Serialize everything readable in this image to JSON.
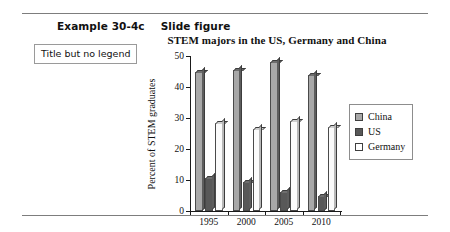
{
  "header": {
    "example_label": "Example 30-4c",
    "kind_label": "Slide figure"
  },
  "callout": {
    "text": "Title but no legend"
  },
  "chart_data": {
    "type": "bar",
    "title": "STEM majors in the US, Germany and China",
    "xlabel": "",
    "ylabel": "Percent of STEM graduates",
    "categories": [
      "1995",
      "2000",
      "2005",
      "2010"
    ],
    "yticks": [
      "0",
      "10",
      "20",
      "30",
      "40",
      "50"
    ],
    "ylim": [
      0,
      50
    ],
    "grid": false,
    "legend_position": "right",
    "series": [
      {
        "name": "China",
        "values": [
          45,
          45.5,
          48,
          44
        ],
        "color": "#a8a8a8"
      },
      {
        "name": "US",
        "values": [
          10.5,
          9.5,
          6,
          5
        ],
        "color": "#585858"
      },
      {
        "name": "Germany",
        "values": [
          28.5,
          26.5,
          29,
          27
        ],
        "color": "#ffffff"
      }
    ]
  }
}
